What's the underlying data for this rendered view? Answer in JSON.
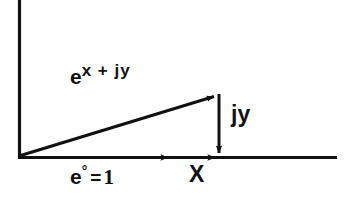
{
  "figure": {
    "type": "vector-diagram",
    "background_color": "#ffffff",
    "stroke_color": "#111111",
    "width": 358,
    "height": 217
  },
  "axes": {
    "vertical": {
      "name": "imaginary-axis",
      "x": 19,
      "y_top": 0,
      "y_bottom": 157
    },
    "horizontal": {
      "name": "real-axis",
      "y": 157,
      "x_left": 18,
      "x_right": 337
    }
  },
  "origin": {
    "x": 18,
    "y": 157
  },
  "vectors": {
    "resultant": {
      "name": "resultant-vector",
      "from": {
        "x": 18,
        "y": 157
      },
      "to": {
        "x": 219,
        "y": 95
      },
      "arrowhead": "end"
    },
    "imaginary_component": {
      "name": "imaginary-component",
      "from": {
        "x": 219,
        "y": 95
      },
      "to": {
        "x": 219,
        "y": 157
      },
      "arrowhead": "end"
    },
    "unit_segment": {
      "name": "unit-segment",
      "from": {
        "x": 18,
        "y": 157
      },
      "to": {
        "x": 172,
        "y": 157
      },
      "arrowhead": "end"
    },
    "real_component": {
      "name": "real-component",
      "from": {
        "x": 172,
        "y": 157
      },
      "to": {
        "x": 219,
        "y": 157
      },
      "arrowhead": "end"
    }
  },
  "labels": {
    "vector": {
      "base": "e",
      "superscript": "x + jy",
      "full": "e^(x+jy)"
    },
    "unit": {
      "base": "e",
      "superscript": "°",
      "equals": "=",
      "value": "1",
      "full": "e° = 1"
    },
    "imaginary": "jy",
    "real": "X"
  }
}
